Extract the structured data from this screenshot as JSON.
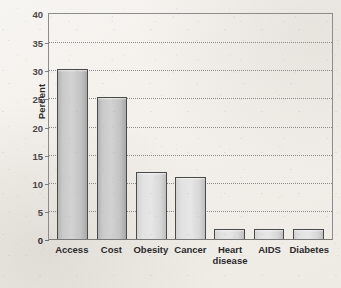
{
  "chart_data": {
    "type": "bar",
    "title": "",
    "subtitle": "",
    "xlabel": "",
    "ylabel": "Percent",
    "categories": [
      "Access",
      "Cost",
      "Obesity",
      "Cancer",
      "Heart disease",
      "AIDS",
      "Diabetes"
    ],
    "values": [
      30.2,
      25.2,
      11.9,
      11.1,
      1.8,
      1.7,
      1.7
    ],
    "ylim": [
      0,
      40
    ],
    "ytick_values": [
      0,
      5,
      10,
      15,
      20,
      25,
      30,
      35,
      40
    ],
    "ytick_labels": [
      "0",
      "5",
      "10",
      "15",
      "20",
      "25",
      "30",
      "35",
      "40"
    ],
    "ytick_step": 5,
    "grid": "horizontal-dotted",
    "legend": "none",
    "legend_position": "none",
    "annotations": [],
    "bar_fill_color": "#d2d2d2",
    "bar_border_color": "#4a4a4a",
    "gridline_color": "#7c7c7c",
    "axis_color": "#8c8c8c",
    "text_color": "#2b2b2b",
    "background_color": "#f4f2ee"
  },
  "axis": {
    "y_title": "Percent",
    "ticks": [
      {
        "label": "40",
        "value": 40
      },
      {
        "label": "35",
        "value": 35
      },
      {
        "label": "30",
        "value": 30
      },
      {
        "label": "25",
        "value": 25
      },
      {
        "label": "20",
        "value": 20
      },
      {
        "label": "15",
        "value": 15
      },
      {
        "label": "10",
        "value": 10
      },
      {
        "label": "5",
        "value": 5
      },
      {
        "label": "0",
        "value": 0
      }
    ]
  },
  "bars": [
    {
      "label": "Access",
      "label_line1": "Access",
      "label_line2": "",
      "value": 30.2
    },
    {
      "label": "Cost",
      "label_line1": "Cost",
      "label_line2": "",
      "value": 25.2
    },
    {
      "label": "Obesity",
      "label_line1": "Obesity",
      "label_line2": "",
      "value": 11.9
    },
    {
      "label": "Cancer",
      "label_line1": "Cancer",
      "label_line2": "",
      "value": 11.1
    },
    {
      "label": "Heart disease",
      "label_line1": "Heart",
      "label_line2": "disease",
      "value": 1.8
    },
    {
      "label": "AIDS",
      "label_line1": "AIDS",
      "label_line2": "",
      "value": 1.7
    },
    {
      "label": "Diabetes",
      "label_line1": "Diabetes",
      "label_line2": "",
      "value": 1.7
    }
  ]
}
